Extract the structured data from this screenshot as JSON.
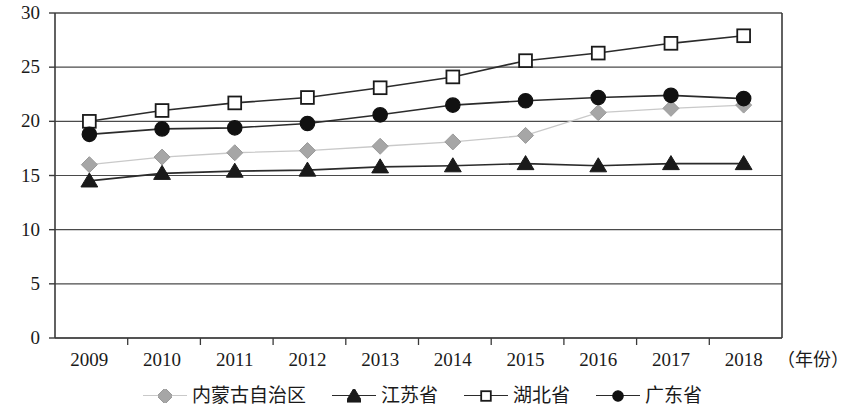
{
  "chart_data": {
    "type": "line",
    "title": "",
    "xlabel": "（年份）",
    "ylabel": "",
    "categories": [
      "2009",
      "2010",
      "2011",
      "2012",
      "2013",
      "2014",
      "2015",
      "2016",
      "2017",
      "2018"
    ],
    "ylim": [
      0,
      30
    ],
    "yticks": [
      0,
      5,
      10,
      15,
      20,
      25,
      30
    ],
    "grid": true,
    "legend_position": "bottom",
    "series": [
      {
        "name": "内蒙古自治区",
        "marker": "diamond",
        "color": "#a6a6a6",
        "line_color": "#c9c9c9",
        "values": [
          16.0,
          16.7,
          17.1,
          17.3,
          17.7,
          18.1,
          18.7,
          20.8,
          21.2,
          21.5
        ]
      },
      {
        "name": "江苏省",
        "marker": "triangle",
        "color": "#1a1a1a",
        "line_color": "#2b2b2b",
        "values": [
          14.5,
          15.2,
          15.4,
          15.5,
          15.8,
          15.9,
          16.1,
          15.9,
          16.1,
          16.1
        ]
      },
      {
        "name": "湖北省",
        "marker": "square",
        "color": "#ffffff",
        "line_color": "#2b2b2b",
        "values": [
          20.0,
          21.0,
          21.7,
          22.2,
          23.1,
          24.1,
          25.6,
          26.3,
          27.2,
          27.9
        ]
      },
      {
        "name": "广东省",
        "marker": "circle",
        "color": "#111111",
        "line_color": "#2b2b2b",
        "values": [
          18.8,
          19.3,
          19.4,
          19.8,
          20.6,
          21.5,
          21.9,
          22.2,
          22.4,
          22.1
        ]
      }
    ]
  },
  "axes": {
    "y_tick_labels": [
      "30",
      "25",
      "20",
      "15",
      "10",
      "5",
      "0"
    ],
    "x_tick_labels": [
      "2009",
      "2010",
      "2011",
      "2012",
      "2013",
      "2014",
      "2015",
      "2016",
      "2017",
      "2018"
    ],
    "x_axis_caption": "（年份）"
  },
  "legend": {
    "items": [
      {
        "label": "内蒙古自治区"
      },
      {
        "label": "江苏省"
      },
      {
        "label": "湖北省"
      },
      {
        "label": "广东省"
      }
    ]
  },
  "colors": {
    "axis": "#3a3a3a",
    "grid": "#4a4a4a",
    "text": "#1a1a1a",
    "gray_series": "#a6a6a6",
    "dark_series": "#1a1a1a"
  }
}
